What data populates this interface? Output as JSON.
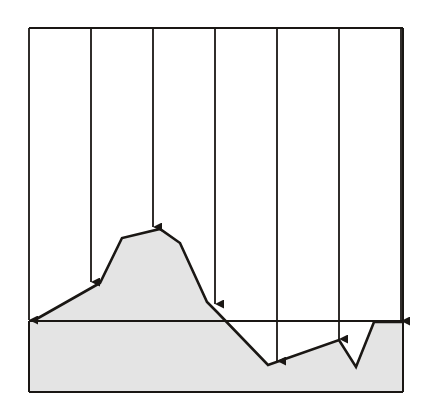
{
  "diagram": {
    "type": "terrain-profile-projection",
    "colors": {
      "background": "#ffffff",
      "stroke": "#1a1714",
      "fill": "#e4e4e4"
    },
    "frame": {
      "left": 29,
      "top": 28,
      "right": 403,
      "baseline": 321,
      "bottom": 392
    },
    "projection_arrows": [
      {
        "x": 29,
        "end_y": 321
      },
      {
        "x": 91,
        "end_y": 283
      },
      {
        "x": 153,
        "end_y": 228
      },
      {
        "x": 215,
        "end_y": 305
      },
      {
        "x": 277,
        "end_y": 362
      },
      {
        "x": 339,
        "end_y": 340
      },
      {
        "x": 401,
        "end_y": 322
      }
    ],
    "profile_points": [
      [
        33,
        321
      ],
      [
        100,
        283
      ],
      [
        122,
        238
      ],
      [
        160,
        229
      ],
      [
        180,
        243
      ],
      [
        207,
        302
      ],
      [
        217,
        312
      ],
      [
        268,
        365
      ],
      [
        339,
        340
      ],
      [
        356,
        367
      ],
      [
        374,
        322
      ],
      [
        403,
        322
      ]
    ]
  }
}
